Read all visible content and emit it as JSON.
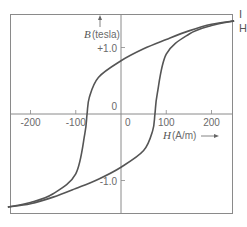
{
  "chart_data": {
    "type": "line",
    "title": "",
    "xlabel": "H (A/m)",
    "ylabel": "B (tesla)",
    "xlabel_var": "H",
    "xlabel_unit": "(A/m)",
    "ylabel_var": "B",
    "ylabel_unit": "(tesla)",
    "xlim": [
      -250,
      250
    ],
    "ylim": [
      -1.6,
      1.6
    ],
    "x_ticks": [
      -200,
      -100,
      0,
      100,
      200
    ],
    "x_tick_labels": [
      "-200",
      "-100",
      "0",
      "100",
      "200"
    ],
    "y_ticks": [
      1.0,
      0,
      -1.0
    ],
    "y_tick_labels": [
      "+1.0",
      "0",
      "-1.0"
    ],
    "grid": false,
    "legend": null,
    "series": [
      {
        "name": "Descending branch (upper)",
        "x": [
          250,
          200,
          150,
          100,
          50,
          0,
          -50,
          -70,
          -75,
          -80,
          -100,
          -150,
          -200,
          -250
        ],
        "y": [
          1.4,
          1.35,
          1.25,
          1.12,
          0.98,
          0.8,
          0.55,
          0.25,
          0.0,
          -0.3,
          -0.9,
          -1.2,
          -1.33,
          -1.4
        ]
      },
      {
        "name": "Ascending branch (lower)",
        "x": [
          -250,
          -200,
          -150,
          -100,
          -50,
          0,
          50,
          70,
          75,
          80,
          100,
          150,
          200,
          250
        ],
        "y": [
          -1.4,
          -1.35,
          -1.25,
          -1.12,
          -0.98,
          -0.8,
          -0.55,
          -0.25,
          0.0,
          0.3,
          0.9,
          1.2,
          1.33,
          1.4
        ]
      }
    ],
    "annotations": {
      "coercive_field": 75,
      "remanence": 0.8,
      "saturation": 1.4
    }
  },
  "side_fragments": [
    "I",
    "H"
  ]
}
